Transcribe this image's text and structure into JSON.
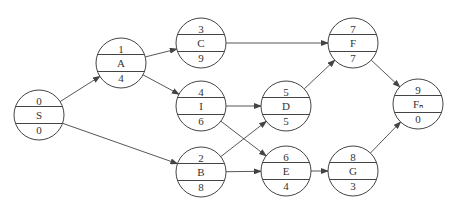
{
  "diagram": {
    "type": "activity-on-node network",
    "node_radius": 25,
    "line_color": "#444444",
    "nodes": [
      {
        "id": "S",
        "top": "0",
        "label": "S",
        "bottom": "0",
        "cx": 39,
        "cy": 115
      },
      {
        "id": "A",
        "top": "1",
        "label": "A",
        "bottom": "4",
        "cx": 121,
        "cy": 63
      },
      {
        "id": "C",
        "top": "3",
        "label": "C",
        "bottom": "9",
        "cx": 201,
        "cy": 43
      },
      {
        "id": "I",
        "top": "4",
        "label": "I",
        "bottom": "6",
        "cx": 201,
        "cy": 106
      },
      {
        "id": "B",
        "top": "2",
        "label": "B",
        "bottom": "8",
        "cx": 201,
        "cy": 172
      },
      {
        "id": "D",
        "top": "5",
        "label": "D",
        "bottom": "5",
        "cx": 286,
        "cy": 106
      },
      {
        "id": "E",
        "top": "6",
        "label": "E",
        "bottom": "4",
        "cx": 286,
        "cy": 171
      },
      {
        "id": "F",
        "top": "7",
        "label": "F",
        "bottom": "7",
        "cx": 353,
        "cy": 43
      },
      {
        "id": "G",
        "top": "8",
        "label": "G",
        "bottom": "3",
        "cx": 353,
        "cy": 171
      },
      {
        "id": "Fn",
        "top": "9",
        "label": "Fₙ",
        "bottom": "0",
        "cx": 418,
        "cy": 104
      }
    ],
    "edges": [
      {
        "from": "S",
        "to": "A"
      },
      {
        "from": "S",
        "to": "B"
      },
      {
        "from": "A",
        "to": "C"
      },
      {
        "from": "A",
        "to": "I"
      },
      {
        "from": "C",
        "to": "F"
      },
      {
        "from": "I",
        "to": "D"
      },
      {
        "from": "I",
        "to": "E"
      },
      {
        "from": "B",
        "to": "D"
      },
      {
        "from": "B",
        "to": "E"
      },
      {
        "from": "D",
        "to": "F"
      },
      {
        "from": "E",
        "to": "G"
      },
      {
        "from": "F",
        "to": "Fn"
      },
      {
        "from": "G",
        "to": "Fn"
      }
    ]
  }
}
